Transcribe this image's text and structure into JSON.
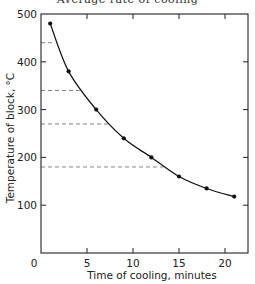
{
  "figure": {
    "title_fragment": "Average rate of cooling"
  },
  "chart_data": {
    "type": "line",
    "title": "",
    "xlabel": "Time of cooling, minutes",
    "ylabel": "Temperature of block, °C",
    "xlim": [
      0,
      22.5
    ],
    "ylim": [
      0,
      500
    ],
    "x_ticks": [
      0,
      5,
      10,
      15,
      20
    ],
    "y_ticks": [
      100,
      200,
      300,
      400,
      500
    ],
    "grid": false,
    "legend": null,
    "series": [
      {
        "name": "Temperature of block",
        "x": [
          1,
          3,
          6,
          9,
          12,
          15,
          18,
          21
        ],
        "values": [
          480,
          380,
          300,
          240,
          200,
          160,
          135,
          118
        ],
        "marker": "filled-circle",
        "color": "#111111"
      }
    ],
    "reference_lines": [
      {
        "type": "horizontal-dashed",
        "y": 440,
        "x_from": 0,
        "x_to": 1.5
      },
      {
        "type": "horizontal-dashed",
        "y": 340,
        "x_from": 0,
        "x_to": 4.2
      },
      {
        "type": "horizontal-dashed",
        "y": 270,
        "x_from": 0,
        "x_to": 7.5
      },
      {
        "type": "horizontal-dashed",
        "y": 180,
        "x_from": 0,
        "x_to": 13.3
      }
    ],
    "colors": {
      "axis": "#222222",
      "line": "#111111",
      "dashed": "#777777"
    }
  }
}
